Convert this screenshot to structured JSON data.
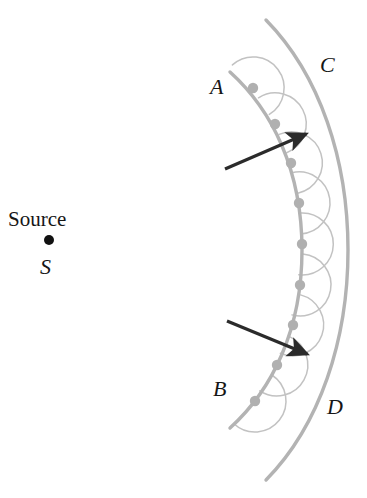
{
  "figure": {
    "background_color": "#ffffff"
  },
  "labels": {
    "source_text": "Source",
    "source_point": "S",
    "wavefront_inner_top": "A",
    "wavefront_inner_bottom": "B",
    "wavefront_outer_top": "C",
    "wavefront_outer_bottom": "D"
  },
  "colors": {
    "wavefront": "#b3b3b3",
    "wavelet": "#c2c2c2",
    "point_dot": "#b0b0b0",
    "arrow": "#2b2b2b",
    "source_dot": "#111111",
    "text": "#161616"
  },
  "geometry": {
    "source_point": {
      "x": 49,
      "y": 240,
      "radius": 5
    },
    "inner_wavefront": {
      "name": "AB",
      "path": "M 230 72 C 272 110, 302 170, 302 250 C 302 330, 272 390, 230 428",
      "stroke_width": 3.4
    },
    "outer_wavefront": {
      "name": "CD",
      "path": "M 266 20 C 320 75, 348 160, 348 250 C 348 340, 320 425, 266 480",
      "stroke_width": 3.4
    },
    "wavelet_radius": 31,
    "wavelet_stroke_width": 1.5,
    "wavelet_sweep_degrees": 190,
    "source_points": [
      {
        "x": 253,
        "y": 88
      },
      {
        "x": 275,
        "y": 124
      },
      {
        "x": 291,
        "y": 163
      },
      {
        "x": 299,
        "y": 203
      },
      {
        "x": 302,
        "y": 244
      },
      {
        "x": 300,
        "y": 285
      },
      {
        "x": 293,
        "y": 325
      },
      {
        "x": 277,
        "y": 365
      },
      {
        "x": 255,
        "y": 401
      }
    ],
    "point_dot_radius": 5.2,
    "arrows": [
      {
        "name": "upper-ray",
        "x1": 225,
        "y1": 169,
        "x2": 306,
        "y2": 134
      },
      {
        "name": "lower-ray",
        "x1": 227,
        "y1": 321,
        "x2": 307,
        "y2": 354
      }
    ],
    "arrow_stroke_width": 3.2,
    "arrow_head_length": 13
  },
  "chart_data": {
    "type": "diagram",
    "elements": [
      {
        "name": "Source",
        "kind": "point",
        "label": "S"
      },
      {
        "name": "Wavefront AB",
        "kind": "arc",
        "labels": [
          "A",
          "B"
        ]
      },
      {
        "name": "Wavefront CD",
        "kind": "arc",
        "labels": [
          "C",
          "D"
        ]
      },
      {
        "name": "Secondary wavelets",
        "kind": "arcs",
        "count": 9
      },
      {
        "name": "Propagation rays",
        "kind": "arrows",
        "count": 2
      }
    ]
  }
}
